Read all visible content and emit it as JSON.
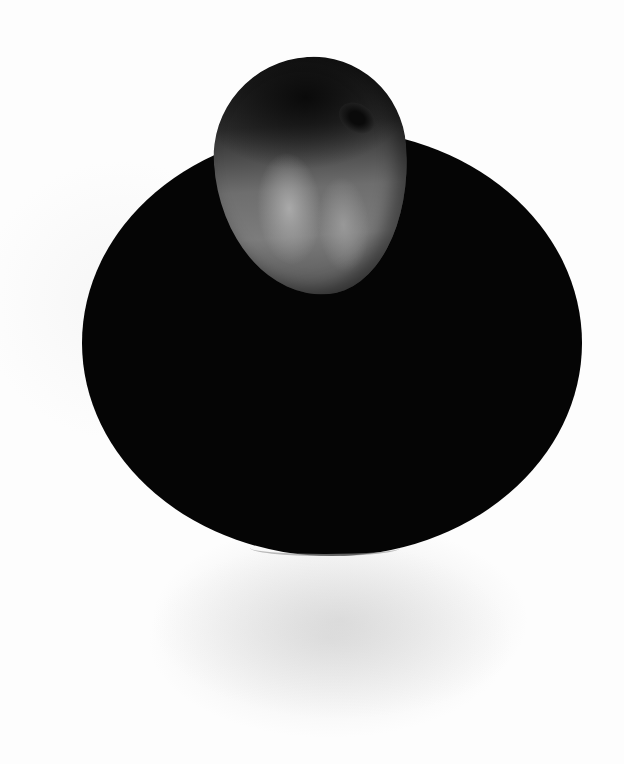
{
  "image": {
    "description": "Black-and-white photograph of a single peach resting near the top edge of a dark round plate on a white background",
    "subjects": [
      {
        "name": "peach",
        "position": "top-center, overlapping plate rim"
      },
      {
        "name": "plate",
        "position": "center",
        "color": "#050505"
      }
    ],
    "background_color": "#fdfdfd"
  }
}
